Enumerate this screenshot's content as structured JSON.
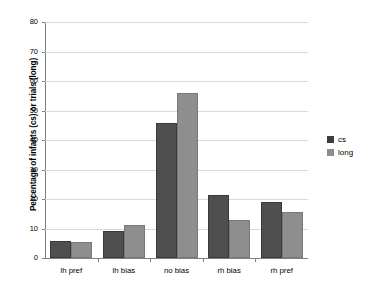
{
  "chart_data": {
    "type": "bar",
    "title": "",
    "xlabel": "",
    "ylabel": "Percentage of infants (cs) or trials (long)",
    "ylim": [
      0,
      80
    ],
    "yticks": [
      0,
      10,
      20,
      30,
      40,
      50,
      60,
      70,
      80
    ],
    "ytick_labels": [
      "0",
      "10",
      "20",
      "30",
      "40",
      "50",
      "60",
      "70",
      "80"
    ],
    "grid": true,
    "legend_position": "right",
    "categories": [
      "lh pref",
      "lh bias",
      "no bias",
      "rh bias",
      "rh pref"
    ],
    "series": [
      {
        "name": "cs",
        "color": "#4f4f4f",
        "values": [
          5.7,
          9.3,
          45.7,
          21.2,
          19.0
        ]
      },
      {
        "name": "long",
        "color": "#8e8e8e",
        "values": [
          5.5,
          11.2,
          55.8,
          12.8,
          15.6
        ]
      }
    ]
  },
  "legend": {
    "items": [
      {
        "label": "cs",
        "swatch": "cs-swatch"
      },
      {
        "label": "long",
        "swatch": "long-swatch"
      }
    ]
  }
}
